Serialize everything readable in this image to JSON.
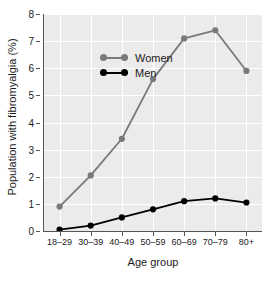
{
  "chart_data": {
    "type": "line",
    "title": "",
    "xlabel": "Age group",
    "ylabel": "Population with fibromyalgia (%)",
    "categories": [
      "18–29",
      "30–39",
      "40–49",
      "50–59",
      "60–69",
      "70–79",
      "80+"
    ],
    "series": [
      {
        "name": "Women",
        "color": "#7a7a7a",
        "values": [
          0.9,
          2.05,
          3.4,
          5.6,
          7.1,
          7.4,
          5.9
        ]
      },
      {
        "name": "Men",
        "color": "#000000",
        "values": [
          0.05,
          0.2,
          0.5,
          0.8,
          1.1,
          1.2,
          1.05
        ]
      }
    ],
    "ylim": [
      0,
      8
    ],
    "yticks": [
      0,
      1,
      2,
      3,
      4,
      5,
      6,
      7,
      8
    ],
    "ytick_labels": [
      "0",
      "1",
      "2",
      "3",
      "4",
      "5",
      "6",
      "7",
      "8"
    ],
    "grid": true,
    "legend_position": "inside-top-left",
    "panel_background": "#ebebeb",
    "gridline_color": "#ffffff"
  }
}
